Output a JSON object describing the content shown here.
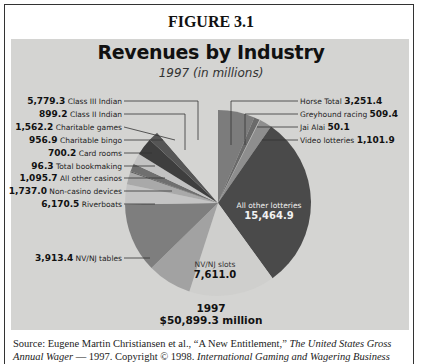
{
  "figure_label": "FIGURE 3.1",
  "chart_data": {
    "type": "pie",
    "title": "Revenues by Industry",
    "subtitle": "1997 (in millions)",
    "total_label_year": "1997",
    "total_label_value": "$50,899.3 million",
    "total": 50899.3,
    "slices": [
      {
        "label": "Horse Total",
        "value": 3251.4,
        "display": "3,251.4",
        "color": "#7c7c7c",
        "side": "right"
      },
      {
        "label": "Greyhound racing",
        "value": 509.4,
        "display": "509.4",
        "color": "#6a6a6a",
        "side": "right"
      },
      {
        "label": "Jai Alai",
        "value": 50.1,
        "display": "50.1",
        "color": "#bdbdbd",
        "side": "right"
      },
      {
        "label": "Video lotteries",
        "value": 1101.9,
        "display": "1,101.9",
        "color": "#8e8e8e",
        "side": "right"
      },
      {
        "label": "All other lotteries",
        "value": 15464.9,
        "display": "15,464.9",
        "color": "#4a4a4a",
        "side": "inside"
      },
      {
        "label": "NV/NJ slots",
        "value": 7611.0,
        "display": "7,611.0",
        "color": "#cfcfcd",
        "side": "inside"
      },
      {
        "label": "NV/NJ tables",
        "value": 3913.4,
        "display": "3,913.4",
        "color": "#a2a2a2",
        "side": "left"
      },
      {
        "label": "Riverboats",
        "value": 6170.5,
        "display": "6,170.5",
        "color": "#7e7e7e",
        "side": "left"
      },
      {
        "label": "Non-casino devices",
        "value": 1737.0,
        "display": "1,737.0",
        "color": "#c4c4c4",
        "side": "left"
      },
      {
        "label": "All other casinos",
        "value": 1095.7,
        "display": "1,095.7",
        "color": "#a9a9a9",
        "side": "left"
      },
      {
        "label": "Total bookmaking",
        "value": 96.3,
        "display": "96.3",
        "color": "#595959",
        "side": "left"
      },
      {
        "label": "Card rooms",
        "value": 700.2,
        "display": "700.2",
        "color": "#6f6f6f",
        "side": "left"
      },
      {
        "label": "Charitable bingo",
        "value": 956.9,
        "display": "956.9",
        "color": "#c2c2c2",
        "side": "left"
      },
      {
        "label": "Charitable games",
        "value": 1562.2,
        "display": "1,562.2",
        "color": "#3e3e3e",
        "side": "left"
      },
      {
        "label": "Class II Indian",
        "value": 899.2,
        "display": "899.2",
        "color": "#555555",
        "side": "left"
      },
      {
        "label": "Class III Indian",
        "value": 5779.3,
        "display": "5,779.3",
        "color": "#d4d4d2",
        "side": "left"
      }
    ],
    "legend_position": "callout labels",
    "grid": false
  },
  "labels_left": [
    {
      "value": "5,779.3",
      "text": "Class III Indian"
    },
    {
      "value": "899.2",
      "text": "Class II Indian"
    },
    {
      "value": "1,562.2",
      "text": "Charitable games"
    },
    {
      "value": "956.9",
      "text": "Charitable bingo"
    },
    {
      "value": "700.2",
      "text": "Card rooms"
    },
    {
      "value": "96.3",
      "text": "Total bookmaking"
    },
    {
      "value": "1,095.7",
      "text": "All other casinos"
    },
    {
      "value": "1,737.0",
      "text": "Non-casino devices"
    },
    {
      "value": "6,170.5",
      "text": "Riverboats"
    },
    {
      "value": "3,913.4",
      "text": "NV/NJ tables"
    }
  ],
  "labels_right": [
    {
      "text": "Horse Total",
      "value": "3,251.4"
    },
    {
      "text": "Greyhound racing",
      "value": "509.4"
    },
    {
      "text": "Jai Alai",
      "value": "50.1"
    },
    {
      "text": "Video lotteries",
      "value": "1,101.9"
    }
  ],
  "inside_labels": {
    "lotteries": {
      "text": "All other lotteries",
      "value": "15,464.9"
    },
    "slots": {
      "text": "NV/NJ slots",
      "value": "7,611.0"
    }
  },
  "source": {
    "prefix": "Source: Eugene Martin Christiansen et al., “A New Entitlement,” ",
    "title_italic": "The United States Gross",
    "line2_italic_start": "Annual Wager",
    "line2_mid": " — 1997. Copyright © 1998. ",
    "line2_italic_end": "International Gaming and Wagering Business"
  }
}
